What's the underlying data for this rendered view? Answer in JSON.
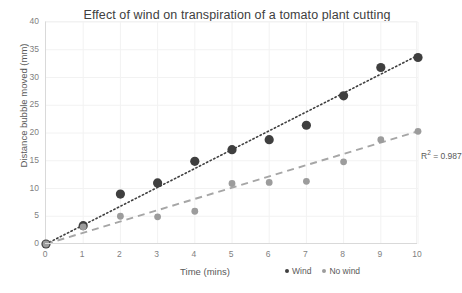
{
  "chart_data": {
    "type": "scatter",
    "title": "Effect of wind on transpiration of a tomato plant cutting",
    "xlabel": "Time (mins)",
    "ylabel": "Distance bubble moved (mm)",
    "xlim": [
      0,
      10
    ],
    "ylim": [
      0,
      40
    ],
    "xticks": [
      0,
      1,
      2,
      3,
      4,
      5,
      6,
      7,
      8,
      9,
      10
    ],
    "yticks": [
      0,
      5,
      10,
      15,
      20,
      25,
      30,
      35,
      40
    ],
    "grid": true,
    "legend_position": "bottom-right",
    "annotations": [
      {
        "text": "R² = 0.987",
        "text_prefix": "R",
        "text_sup": "2",
        "text_suffix": " = 0.987",
        "x": 10,
        "y": 21,
        "series": "No wind"
      }
    ],
    "x": [
      0,
      1,
      2,
      3,
      4,
      5,
      6,
      7,
      8,
      9,
      10
    ],
    "series": [
      {
        "name": "Wind",
        "color": "#3f3f3f",
        "marker": "circle",
        "marker_size": 4.6,
        "values": [
          0,
          3.3,
          9.0,
          11.0,
          14.9,
          17.0,
          18.8,
          21.4,
          26.7,
          31.8,
          33.6
        ],
        "trendline": {
          "style": "dotted",
          "color": "#3f3f3f",
          "from": [
            0,
            0
          ],
          "to": [
            10,
            34.0
          ]
        }
      },
      {
        "name": "No wind",
        "color": "#9c9c9c",
        "marker": "circle",
        "marker_size": 3.4,
        "values": [
          0,
          3.1,
          5.0,
          4.9,
          5.9,
          10.9,
          11.1,
          11.3,
          14.8,
          18.8,
          20.3
        ],
        "trendline": {
          "style": "dashed",
          "color": "#a6a6a6",
          "from": [
            0,
            0
          ],
          "to": [
            10,
            20.3
          ]
        }
      }
    ]
  },
  "legend": {
    "items": [
      {
        "label": "Wind",
        "color": "#3f3f3f"
      },
      {
        "label": "No wind",
        "color": "#9c9c9c"
      }
    ]
  },
  "colors": {
    "background": "#ffffff",
    "gridline": "#f2f2f2",
    "axis": "#d9d9d9",
    "text": "#595959",
    "title_text": "#404040",
    "wind": "#3f3f3f",
    "no_wind": "#9c9c9c"
  }
}
